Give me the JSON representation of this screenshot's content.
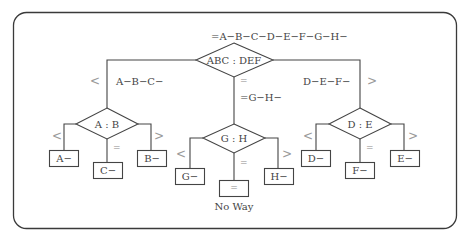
{
  "diagram": {
    "title": "=A−B−C−D−E−F−G−H−",
    "root": {
      "label": "ABC : DEF",
      "branches": {
        "less": {
          "symbol": "<",
          "label": "A−B−C−"
        },
        "equal": {
          "symbol": "=",
          "label": "=G−H−"
        },
        "greater": {
          "symbol": ">",
          "label": "D−E−F−"
        }
      }
    },
    "left_node": {
      "label": "A : B",
      "less_symbol": "<",
      "equal_symbol": "=",
      "greater_symbol": ">",
      "less_result": "A−",
      "equal_result": "C−",
      "greater_result": "B−"
    },
    "middle_node": {
      "label": "G : H",
      "less_symbol": "<",
      "equal_symbol": "=",
      "greater_symbol": ">",
      "less_result": "G−",
      "equal_result": "=",
      "equal_caption": "No Way",
      "greater_result": "H−"
    },
    "right_node": {
      "label": "D : E",
      "less_symbol": "<",
      "equal_symbol": "=",
      "greater_symbol": ">",
      "less_result": "D−",
      "equal_result": "F−",
      "greater_result": "E−"
    }
  }
}
